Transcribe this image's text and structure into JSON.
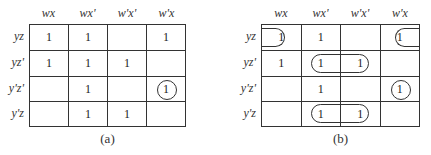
{
  "maps": [
    {
      "id": "a",
      "caption": "(a)",
      "col_headers": [
        "wx",
        "wx'",
        "w'x'",
        "w'x"
      ],
      "row_headers": [
        "yz",
        "yz'",
        "y'z'",
        "y'z"
      ],
      "cells": [
        [
          "1",
          "1",
          "",
          "1"
        ],
        [
          "1",
          "1",
          "1",
          ""
        ],
        [
          "",
          "1",
          "",
          "1"
        ],
        [
          "",
          "1",
          "1",
          ""
        ]
      ]
    },
    {
      "id": "b",
      "caption": "(b)",
      "col_headers": [
        "wx",
        "wx'",
        "w'x'",
        "w'x"
      ],
      "row_headers": [
        "yz",
        "yz'",
        "y'z'",
        "y'z"
      ],
      "cells": [
        [
          "1",
          "1",
          "",
          "1"
        ],
        [
          "1",
          "1",
          "1",
          ""
        ],
        [
          "",
          "1",
          "",
          "1"
        ],
        [
          "",
          "1",
          "1",
          ""
        ]
      ]
    }
  ],
  "groupings": {
    "a": [
      {
        "type": "circle",
        "cells": [
          [
            2,
            3
          ]
        ],
        "label": "w'xy'z'"
      }
    ],
    "b": [
      {
        "type": "wrap-pair",
        "cells": [
          [
            0,
            0
          ],
          [
            0,
            3
          ]
        ],
        "label": "xyz"
      },
      {
        "type": "pair",
        "cells": [
          [
            1,
            1
          ],
          [
            1,
            2
          ]
        ],
        "label": "x'yz'"
      },
      {
        "type": "circle",
        "cells": [
          [
            2,
            3
          ]
        ],
        "label": "w'xy'z'"
      },
      {
        "type": "pair",
        "cells": [
          [
            3,
            1
          ],
          [
            3,
            2
          ]
        ],
        "label": "x'y'z"
      }
    ]
  }
}
